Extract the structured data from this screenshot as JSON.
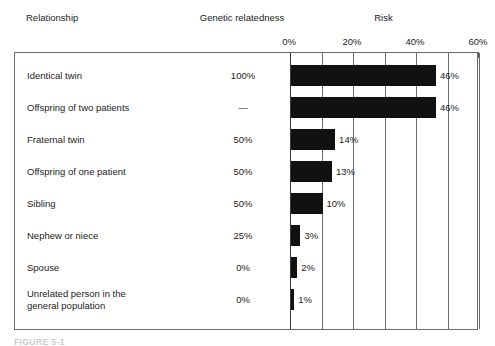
{
  "headers": {
    "relationship": "Relationship",
    "genetic_relatedness": "Genetic relatedness",
    "risk": "Risk"
  },
  "caption": "FIGURE 5-1",
  "colors": {
    "bar": "#111111",
    "frame": "#6a6a6a",
    "text": "#232323"
  },
  "chart_data": {
    "type": "bar",
    "title": "Risk",
    "xlabel": "Risk",
    "ylabel": "Relationship",
    "orientation": "horizontal",
    "xlim": [
      0,
      60
    ],
    "xticks": [
      0,
      10,
      20,
      30,
      40,
      50,
      60
    ],
    "xtick_labels": [
      "0%",
      "20%",
      "40%",
      "60%"
    ],
    "xtick_label_values": [
      0,
      20,
      40,
      60
    ],
    "grid": true,
    "legend": "none",
    "categories": [
      "Identical twin",
      "Offspring of two patients",
      "Fraternal twin",
      "Offspring of one patient",
      "Sibling",
      "Nephew or niece",
      "Spouse",
      "Unrelated person in the general population"
    ],
    "values": [
      46,
      46,
      14,
      13,
      10,
      3,
      2,
      1
    ],
    "value_labels": [
      "46%",
      "46%",
      "14%",
      "13%",
      "10%",
      "3%",
      "2%",
      "1%"
    ],
    "genetic_relatedness": [
      "100%",
      "—",
      "50%",
      "50%",
      "50%",
      "25%",
      "0%",
      "0%"
    ]
  },
  "rows": [
    {
      "label": "Identical twin",
      "label_line2": "",
      "genetic": "100%",
      "risk": 46,
      "risk_label": "46%"
    },
    {
      "label": "Offspring of two patients",
      "label_line2": "",
      "genetic": "—",
      "risk": 46,
      "risk_label": "46%"
    },
    {
      "label": "Fraternal twin",
      "label_line2": "",
      "genetic": "50%",
      "risk": 14,
      "risk_label": "14%"
    },
    {
      "label": "Offspring of one patient",
      "label_line2": "",
      "genetic": "50%",
      "risk": 13,
      "risk_label": "13%"
    },
    {
      "label": "Sibling",
      "label_line2": "",
      "genetic": "50%",
      "risk": 10,
      "risk_label": "10%"
    },
    {
      "label": "Nephew or niece",
      "label_line2": "",
      "genetic": "25%",
      "risk": 3,
      "risk_label": "3%"
    },
    {
      "label": "Spouse",
      "label_line2": "",
      "genetic": "0%",
      "risk": 2,
      "risk_label": "2%"
    },
    {
      "label": "Unrelated person in the",
      "label_line2": "general population",
      "genetic": "0%",
      "risk": 1,
      "risk_label": "1%"
    }
  ],
  "axis": {
    "labels": [
      {
        "text": "0%",
        "value": 0
      },
      {
        "text": "20%",
        "value": 20
      },
      {
        "text": "40%",
        "value": 40
      },
      {
        "text": "60%",
        "value": 60
      }
    ],
    "ticks": [
      0,
      10,
      20,
      30,
      40,
      50,
      60
    ],
    "max": 60
  }
}
